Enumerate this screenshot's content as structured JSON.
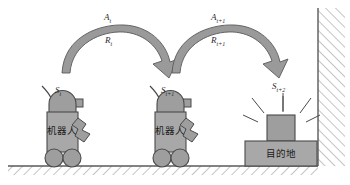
{
  "diagram": {
    "colors": {
      "fill_gray": "#9e9e9e",
      "fill_gray_light": "#a8a8a8",
      "stroke_dark": "#4a4a4a",
      "arrow_fill": "#9a9a9a",
      "text_dark": "#2b2b2b",
      "background": "#ffffff",
      "hatch_stroke": "#8a8a8a"
    },
    "transitions": [
      {
        "id": "transition-1",
        "action_base": "A",
        "action_sub": "t",
        "reward_base": "R",
        "reward_sub": "t"
      },
      {
        "id": "transition-2",
        "action_base": "A",
        "action_sub": "t+1",
        "reward_base": "R",
        "reward_sub": "t+1"
      }
    ],
    "states": [
      {
        "id": "state-1",
        "base": "S",
        "sub": "t"
      },
      {
        "id": "state-2",
        "base": "S",
        "sub": "t+1"
      },
      {
        "id": "state-3",
        "base": "S",
        "sub": "t+2"
      }
    ],
    "robots": [
      {
        "id": "robot-1",
        "body_label": "机器人"
      },
      {
        "id": "robot-2",
        "body_label": "机器人"
      }
    ],
    "destination": {
      "id": "destination",
      "label": "目的地"
    },
    "environment": {
      "ground_label": "ground-hatched",
      "wall_label": "wall-hatched"
    }
  }
}
